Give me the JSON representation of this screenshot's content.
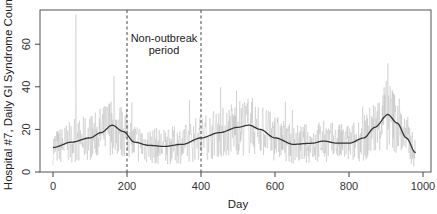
{
  "chart_data": {
    "type": "line",
    "title": "",
    "xlabel": "Day",
    "ylabel": "Hospital #7, Daily GI Syndrome Count",
    "xlim": [
      -35,
      1030
    ],
    "ylim": [
      0,
      76
    ],
    "x_ticks": [
      0,
      200,
      400,
      600,
      800,
      1000
    ],
    "y_ticks": [
      0,
      20,
      40,
      60
    ],
    "grid": false,
    "legend": null,
    "annotations": [
      {
        "text_lines": [
          "Non-outbreak",
          "period"
        ],
        "x": 300,
        "y": 64
      },
      {
        "type": "vline",
        "x": 200,
        "style": "dashed"
      },
      {
        "type": "vline",
        "x": 400,
        "style": "dashed"
      }
    ],
    "series": [
      {
        "name": "Daily count",
        "style": "thin light gray line",
        "color": "#b8b8b8",
        "description": "noisy daily counts fluctuating roughly 5-30 with spikes",
        "notable_spikes": [
          {
            "x": 62,
            "y": 74
          },
          {
            "x": 165,
            "y": 45
          },
          {
            "x": 905,
            "y": 51
          }
        ]
      },
      {
        "name": "Smoothed trend",
        "style": "solid dark line",
        "color": "#333333",
        "x": [
          0,
          50,
          100,
          130,
          160,
          190,
          220,
          260,
          300,
          350,
          400,
          450,
          500,
          530,
          560,
          600,
          650,
          700,
          730,
          770,
          800,
          840,
          870,
          905,
          930,
          955,
          980
        ],
        "y": [
          11.5,
          14,
          16,
          18.5,
          22,
          19,
          14,
          12.5,
          12,
          13,
          16,
          18.5,
          21,
          22,
          20,
          16,
          13,
          13.5,
          14.5,
          13.5,
          13.5,
          16,
          21,
          27,
          23,
          16,
          9
        ]
      }
    ]
  }
}
